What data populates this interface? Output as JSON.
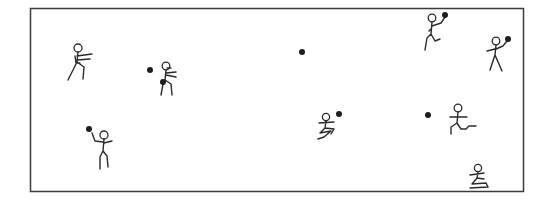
{
  "scene": {
    "description": "Dodgeball game illustration on a rectangular court",
    "colors": {
      "background": "#ffffff",
      "ink": "#2a2a2a",
      "ball": "#1e1e1e"
    },
    "court": {
      "x": 30,
      "y": 8,
      "width": 493,
      "height": 183
    },
    "figures": [
      {
        "id": "player-1",
        "pose": "running-carrying",
        "head": [
          78,
          48
        ]
      },
      {
        "id": "player-2",
        "pose": "crouching-dodging",
        "head": [
          166,
          66
        ]
      },
      {
        "id": "player-3",
        "pose": "standing-throwing",
        "head": [
          104,
          135
        ]
      },
      {
        "id": "player-4",
        "pose": "running-holding-ball",
        "head": [
          432,
          18
        ]
      },
      {
        "id": "player-5",
        "pose": "standing-holding-ball",
        "head": [
          496,
          41
        ]
      },
      {
        "id": "player-6",
        "pose": "sliding-low",
        "head": [
          326,
          117
        ]
      },
      {
        "id": "player-7",
        "pose": "lunging",
        "head": [
          458,
          108
        ]
      },
      {
        "id": "player-8",
        "pose": "kneeling-low",
        "head": [
          478,
          168
        ]
      }
    ],
    "balls": [
      [
        150,
        70
      ],
      [
        163,
        82
      ],
      [
        89,
        129
      ],
      [
        302,
        52
      ],
      [
        445,
        15
      ],
      [
        508,
        39
      ],
      [
        339,
        114
      ],
      [
        428,
        115
      ]
    ]
  }
}
